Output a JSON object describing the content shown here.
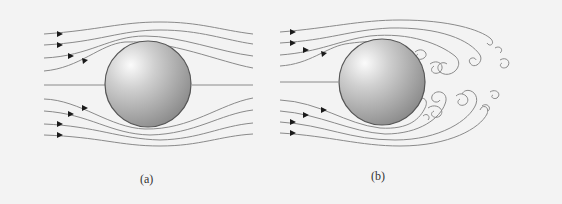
{
  "figure": {
    "panels": [
      {
        "id": "a",
        "label": "(a)",
        "description": "Laminar streamline flow around a sphere"
      },
      {
        "id": "b",
        "label": "(b)",
        "description": "Turbulent flow with vortex wake behind a sphere"
      }
    ],
    "colors": {
      "background": "#f3f3f3",
      "streamline": "#8a8a8a",
      "arrow": "#1a1a1a",
      "sphere_light": "#f2f2f2",
      "sphere_dark": "#8c8c8c",
      "sphere_edge": "#555555"
    }
  }
}
